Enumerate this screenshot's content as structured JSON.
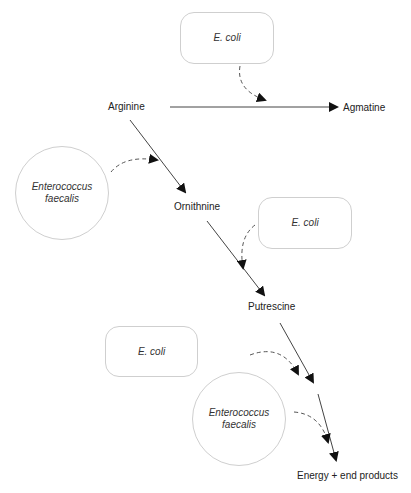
{
  "diagram": {
    "type": "metabolic-pathway",
    "compounds": {
      "arginine": "Arginine",
      "agmatine": "Agmatine",
      "ornithine": "Ornithnine",
      "putrescine": "Putrescine",
      "end": "Energy + end products"
    },
    "organisms": {
      "ecoli_top": "E. coli",
      "efaecalis_left_line1": "Enterococcus",
      "efaecalis_left_line2": "faecalis",
      "ecoli_mid": "E. coli",
      "ecoli_bottom": "E. coli",
      "efaecalis_bottom_line1": "Enterococcus",
      "efaecalis_bottom_line2": "faecalis"
    },
    "edges": [
      {
        "from": "Arginine",
        "to": "Agmatine",
        "catalyst": "E. coli"
      },
      {
        "from": "Arginine",
        "to": "Ornithnine",
        "catalyst": "Enterococcus faecalis"
      },
      {
        "from": "Ornithnine",
        "to": "Putrescine",
        "catalyst": "E. coli"
      },
      {
        "from": "Putrescine",
        "to": "Energy + end products",
        "catalyst": "E. coli"
      },
      {
        "from": "Putrescine",
        "to": "Energy + end products",
        "catalyst": "Enterococcus faecalis"
      }
    ]
  }
}
